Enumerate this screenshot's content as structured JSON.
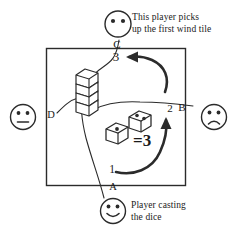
{
  "diagram": {
    "title_top": {
      "line1": "This player picks",
      "line2": "up the first wind tile"
    },
    "title_bottom": {
      "line1": "Player casting",
      "line2": "the dice"
    },
    "table_corners": {
      "top": "C",
      "right": "B",
      "bottom": "A",
      "left": "D"
    },
    "counts": {
      "start": "1",
      "second": "2",
      "third": "3"
    },
    "dice": {
      "die_left_pips": 1,
      "die_right_pips": 2,
      "total_label": "=3"
    },
    "players": {
      "top": {
        "name": "picker-player",
        "expression": "blank-face"
      },
      "left": {
        "name": "left-player",
        "expression": "neutral-face"
      },
      "right": {
        "name": "right-player",
        "expression": "sad-face"
      },
      "bottom": {
        "name": "caster-player",
        "expression": "smiley-face"
      }
    },
    "wall": {
      "name": "tile-wall-stack",
      "layers": 4
    },
    "colors": {
      "ink": "#1a1a1a",
      "paper": "#ffffff"
    }
  }
}
